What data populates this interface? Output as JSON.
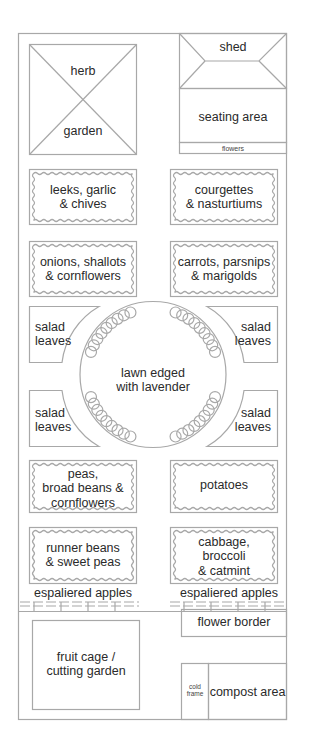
{
  "plan": {
    "colors": {
      "line": "#a8a8a8",
      "text": "#2a2a2a",
      "background": "#ffffff"
    },
    "herb_garden": {
      "top": "herb",
      "bottom": "garden"
    },
    "shed": "shed",
    "seating_area": "seating area",
    "flowers_strip": "flowers",
    "beds_left": [
      {
        "line1": "leeks, garlic",
        "line2": "& chives"
      },
      {
        "line1": "onions, shallots",
        "line2": "& cornflowers"
      },
      {
        "line1": "peas,",
        "line2": "broad beans &",
        "line3": "cornflowers"
      },
      {
        "line1": "runner beans",
        "line2": "& sweet peas"
      }
    ],
    "beds_right": [
      {
        "line1": "courgettes",
        "line2": "& nasturtiums"
      },
      {
        "line1": "carrots, parsnips",
        "line2": "& marigolds"
      },
      {
        "line1": "potatoes"
      },
      {
        "line1": "cabbage,",
        "line2": "broccoli",
        "line3": "& catmint"
      }
    ],
    "salad": {
      "line1": "salad",
      "line2": "leaves"
    },
    "lawn": {
      "line1": "lawn edged",
      "line2": "with lavender"
    },
    "espalier_left": "espaliered apples",
    "espalier_right": "espaliered apples",
    "flower_border": "flower border",
    "fruit_cage": {
      "line1": "fruit cage /",
      "line2": "cutting garden"
    },
    "cold_frame": {
      "line1": "cold",
      "line2": "frame"
    },
    "compost": "compost area"
  }
}
